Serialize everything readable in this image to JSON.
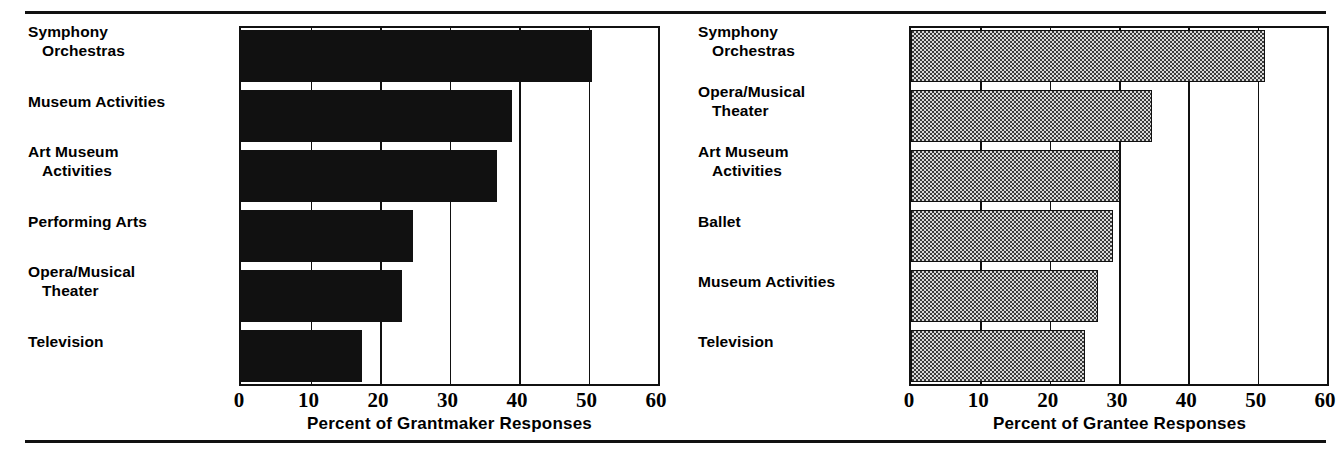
{
  "chart_data": [
    {
      "type": "bar",
      "orientation": "horizontal",
      "name": "grantmaker-chart",
      "title": "",
      "xlabel": "Percent of Grantmaker Responses",
      "ylabel": "",
      "xlim": [
        0,
        60
      ],
      "xticks": [
        0,
        10,
        20,
        30,
        40,
        50,
        60
      ],
      "grid": true,
      "fill": "solid-black",
      "categories": [
        "Symphony Orchestras",
        "Museum Activities",
        "Art  Museum Activities",
        "Performing Arts",
        "Opera/Musical Theater",
        "Television"
      ],
      "category_lines": [
        [
          "Symphony",
          "Orchestras"
        ],
        [
          "Museum Activities",
          ""
        ],
        [
          "Art  Museum",
          "Activities"
        ],
        [
          "Performing Arts",
          ""
        ],
        [
          "Opera/Musical",
          "Theater"
        ],
        [
          "Television",
          ""
        ]
      ],
      "values": [
        50.5,
        39,
        36.8,
        24.7,
        23.2,
        17.4
      ]
    },
    {
      "type": "bar",
      "orientation": "horizontal",
      "name": "grantee-chart",
      "title": "",
      "xlabel": "Percent of Grantee Responses",
      "ylabel": "",
      "xlim": [
        0,
        60
      ],
      "xticks": [
        0,
        10,
        20,
        30,
        40,
        50,
        60
      ],
      "grid": true,
      "fill": "checkered-gray",
      "categories": [
        "Symphony Orchestras",
        "Opera/Musical Theater",
        "Art  Museum Activities",
        "Ballet",
        "Museum Activities",
        "Television"
      ],
      "category_lines": [
        [
          "Symphony",
          "Orchestras"
        ],
        [
          "Opera/Musical",
          "Theater"
        ],
        [
          "Art  Museum",
          "Activities"
        ],
        [
          "Ballet",
          ""
        ],
        [
          "Museum Activities",
          ""
        ],
        [
          "Television",
          ""
        ]
      ],
      "values": [
        51.1,
        34.8,
        30.2,
        29.2,
        27.0,
        25.1
      ]
    }
  ],
  "colors": {
    "ink": "#111111",
    "background": "#ffffff",
    "bar_solid": "#111111",
    "bar_pattern_dark": "#3a3a3a",
    "bar_pattern_light": "#d8d8d8"
  }
}
